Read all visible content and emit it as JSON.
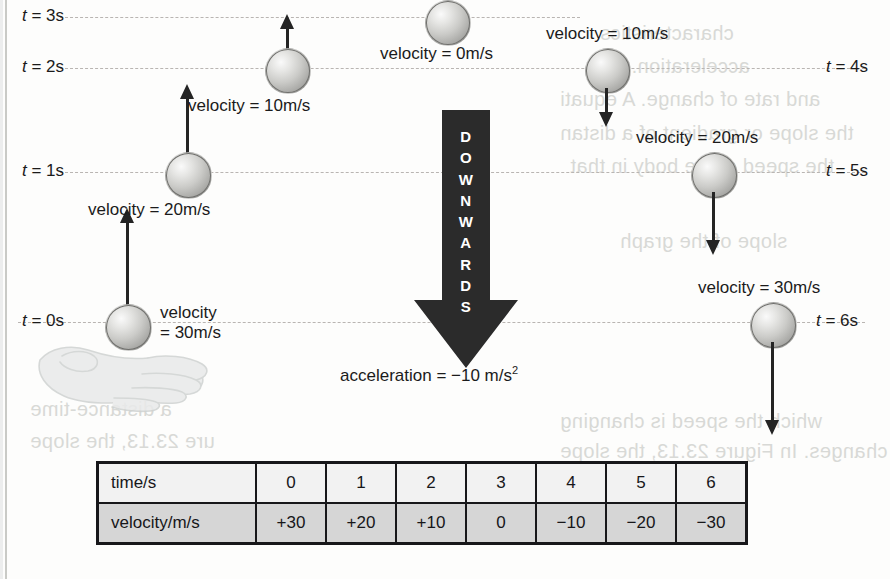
{
  "figure": {
    "downwards_label_letters": [
      "D",
      "O",
      "W",
      "N",
      "W",
      "A",
      "R",
      "D",
      "S"
    ],
    "downwards_label": "DOWNWARDS",
    "acceleration_label": "acceleration = −10 m/s",
    "acceleration_exponent": "2"
  },
  "time_lines": [
    {
      "id": "t3",
      "label": "t = 3s",
      "label_italic": "t",
      "label_rest": " = 3s",
      "side": "left",
      "y": 17
    },
    {
      "id": "t2",
      "label": "t = 2s",
      "side": "left",
      "y": 68
    },
    {
      "id": "t1",
      "label": "t = 1s",
      "side": "left",
      "y": 172
    },
    {
      "id": "t0",
      "label": "t = 0s",
      "side": "left",
      "y": 322
    },
    {
      "id": "t4",
      "label": "t = 4s",
      "side": "right",
      "y": 68
    },
    {
      "id": "t5",
      "label": "t = 5s",
      "side": "right",
      "y": 172
    },
    {
      "id": "t6",
      "label": "t = 6s",
      "side": "right",
      "y": 322
    }
  ],
  "time_labels": {
    "t0": "t = 0s",
    "t1": "t = 1s",
    "t2": "t = 2s",
    "t3": "t = 3s",
    "t4": "t = 4s",
    "t5": "t = 5s",
    "t6": "t = 6s"
  },
  "velocity_labels": {
    "t0_line1": "velocity",
    "t0_line2": "= 30m/s",
    "t1": "velocity = 20m/s",
    "t2": "velocity = 10m/s",
    "t3": "velocity = 0m/s",
    "t4": "velocity = 10m/s",
    "t5": "velocity = 20m/s",
    "t6": "velocity = 30m/s"
  },
  "table": {
    "row_headers": [
      "time/s",
      "velocity/m/s"
    ],
    "time_values": [
      "0",
      "1",
      "2",
      "3",
      "4",
      "5",
      "6"
    ],
    "velocity_values": [
      "+30",
      "+20",
      "+10",
      "0",
      "−10",
      "−20",
      "−30"
    ]
  },
  "chart_data": {
    "type": "table",
    "categories": [
      "0",
      "1",
      "2",
      "3",
      "4",
      "5",
      "6"
    ],
    "xlabel": "time/s",
    "ylabel": "velocity/m/s",
    "series": [
      {
        "name": "velocity/m/s",
        "values": [
          30,
          20,
          10,
          0,
          -10,
          -20,
          -30
        ],
        "display": [
          "+30",
          "+20",
          "+10",
          "0",
          "−10",
          "−20",
          "−30"
        ]
      }
    ],
    "annotations": [
      "acceleration = −10 m/s²",
      "DOWNWARDS"
    ]
  },
  "ghost_text": [
    {
      "text": "characteristics",
      "x": 600,
      "y": 22
    },
    {
      "text": "acceleration. The",
      "x": 590,
      "y": 55
    },
    {
      "text": "and rate of change. A equati",
      "x": 560,
      "y": 88
    },
    {
      "text": "the slope or gradient of a distan",
      "x": 560,
      "y": 122
    },
    {
      "text": "the speed of the body in that",
      "x": 570,
      "y": 155
    },
    {
      "text": "slope of the graph",
      "x": 600,
      "y": 230
    },
    {
      "text": "which the speed is changing",
      "x": 560,
      "y": 410
    },
    {
      "text": "changes. In Figure 23.13, the slope",
      "x": 560,
      "y": 440
    },
    {
      "text": "a distance-time",
      "x": 40,
      "y": 398
    },
    {
      "text": "ure 23.13, the slope",
      "x": 40,
      "y": 430
    }
  ]
}
